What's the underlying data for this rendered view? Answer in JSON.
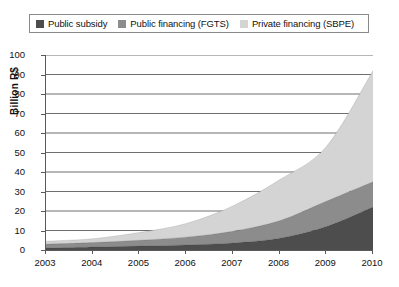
{
  "legend": {
    "position": "top",
    "entries": [
      {
        "label": "Public subsidy",
        "color": "#4d4d4d",
        "icon": "legend-swatch-icon"
      },
      {
        "label": "Public financing (FGTS)",
        "color": "#8c8c8c",
        "icon": "legend-swatch-icon"
      },
      {
        "label": "Private financing (SBPE)",
        "color": "#d4d4d4",
        "icon": "legend-swatch-icon"
      }
    ]
  },
  "axes": {
    "ylabel": "Billion R$",
    "yticks": [
      "0",
      "10",
      "20",
      "30",
      "40",
      "50",
      "60",
      "70",
      "80",
      "90",
      "100"
    ],
    "xticks": [
      "2003",
      "2004",
      "2005",
      "2006",
      "2007",
      "2008",
      "2009",
      "2010"
    ]
  },
  "chart_data": {
    "type": "area",
    "stacked": true,
    "title": "",
    "xlabel": "",
    "ylabel": "Billion R$",
    "ylim": [
      0,
      100
    ],
    "xlim": [
      2003,
      2010
    ],
    "grid": true,
    "grid_axis": "y",
    "legend_position": "top",
    "x": [
      2003,
      2004,
      2005,
      2006,
      2007,
      2008,
      2009,
      2010
    ],
    "categories": [
      "2003",
      "2004",
      "2005",
      "2006",
      "2007",
      "2008",
      "2009",
      "2010"
    ],
    "series": [
      {
        "name": "Public subsidy",
        "color": "#4d4d4d",
        "values": [
          1.0,
          1.5,
          2.0,
          2.6,
          3.6,
          6.0,
          12.0,
          22.0
        ]
      },
      {
        "name": "Public financing (FGTS)",
        "color": "#8c8c8c",
        "values": [
          2.0,
          2.3,
          3.0,
          4.0,
          6.0,
          9.0,
          13.0,
          13.0
        ]
      },
      {
        "name": "Private financing (SBPE)",
        "color": "#d4d4d4",
        "values": [
          1.5,
          2.0,
          4.0,
          7.0,
          13.0,
          21.0,
          28.0,
          57.0
        ]
      }
    ],
    "totals": [
      4.5,
      5.8,
      9.0,
      13.6,
      22.6,
      36.0,
      53.0,
      92.0
    ]
  }
}
